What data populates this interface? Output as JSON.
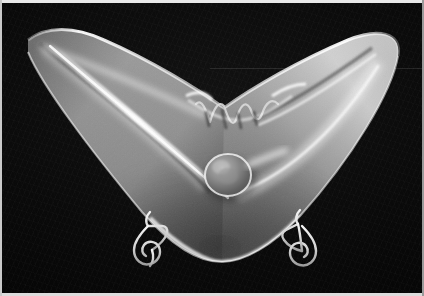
{
  "image": {
    "kind": "photograph",
    "color_mode": "black-and-white",
    "width": 424,
    "height": 296,
    "subject": "wing-shaped glass bowl on wire display stands",
    "background_description": "plain black studio backdrop"
  },
  "palette": {
    "page_background": "#ffffff",
    "frame_edge_light": "#e9e9e9",
    "frame_edge_dim": "#9a9a9a",
    "backdrop_black": "#0a0a0a",
    "backdrop_deep_black": "#020202",
    "glass_midtone": "#9a9a9a",
    "glass_shadow": "#4a4a4a",
    "glass_highlight": "#f4f4f4",
    "specular_white": "#ffffff",
    "wire_stand": "#e2e2e2",
    "knob_shadow": "#5c5c5c"
  },
  "subject": {
    "name": "wing-shaped bowl",
    "parts": [
      {
        "id": "left-wing-tip",
        "label": "left wing tip",
        "x": 30,
        "y": 40
      },
      {
        "id": "right-wing-tip",
        "label": "right wing tip",
        "x": 396,
        "y": 62
      },
      {
        "id": "scalloped-rim",
        "label": "scalloped center rim",
        "x": 242,
        "y": 110,
        "notch_count": 4
      },
      {
        "id": "round-knob",
        "label": "round knob boss",
        "x": 228,
        "y": 175,
        "radius": 22
      },
      {
        "id": "bowl-bottom",
        "label": "bowl bottom curve",
        "x": 222,
        "y": 253
      },
      {
        "id": "specular-streak",
        "label": "long specular highlight streak"
      }
    ],
    "stands": [
      {
        "id": "left-wire-stand",
        "label": "left wire stand",
        "x": 150,
        "y": 243
      },
      {
        "id": "right-wire-stand",
        "label": "right wire stand",
        "x": 306,
        "y": 243
      }
    ]
  },
  "caption": ""
}
